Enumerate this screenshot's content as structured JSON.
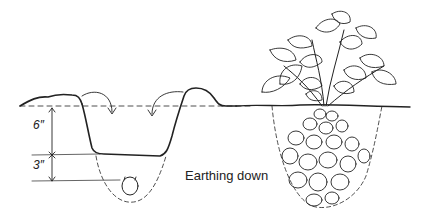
{
  "diagram": {
    "caption": "Earthing down",
    "measurements": {
      "upper": "6″",
      "lower": "3″"
    },
    "colors": {
      "ink": "#222222",
      "background": "#ffffff"
    },
    "panels": [
      {
        "name": "trench-with-seed-potato"
      },
      {
        "name": "grown-plant-with-tubers"
      }
    ]
  }
}
